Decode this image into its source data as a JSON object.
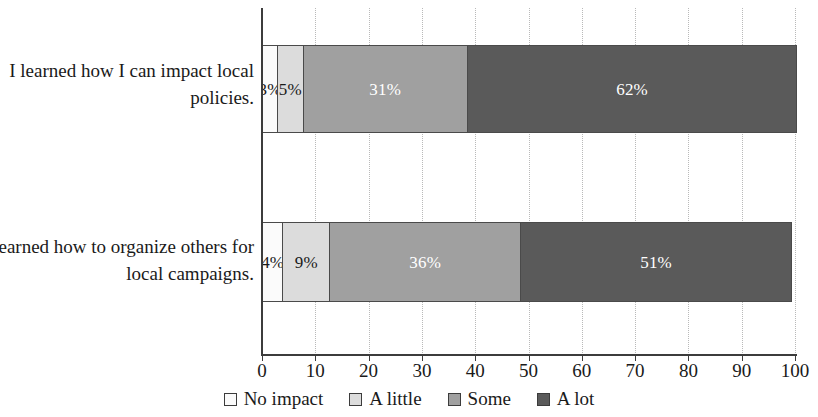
{
  "chart_data": {
    "type": "bar",
    "orientation": "horizontal",
    "stacked": true,
    "stack_mode": "percent",
    "title": "",
    "subtitle": "",
    "xlabel": "",
    "ylabel": "",
    "categories": [
      "I learned how I can impact local policies.",
      "I learned how to organize others for local campaigns."
    ],
    "series": [
      {
        "name": "No impact",
        "values": [
          3,
          4
        ],
        "color": "#fbfbfb"
      },
      {
        "name": "A little",
        "values": [
          5,
          9
        ],
        "color": "#dcdcdc"
      },
      {
        "name": "Some",
        "values": [
          31,
          36
        ],
        "color": "#a0a0a0"
      },
      {
        "name": "A lot",
        "values": [
          62,
          51
        ],
        "color": "#5a5a5a"
      }
    ],
    "data_labels": [
      [
        "3%",
        "5%",
        "31%",
        "62%"
      ],
      [
        "4%",
        "9%",
        "36%",
        "51%"
      ]
    ],
    "label_text_tone": [
      [
        "dark",
        "dark",
        "light",
        "light"
      ],
      [
        "dark",
        "dark",
        "light",
        "light"
      ]
    ],
    "xlim": [
      0,
      100
    ],
    "xticks": [
      0,
      10,
      20,
      30,
      40,
      50,
      60,
      70,
      80,
      90,
      100
    ],
    "xtick_labels": [
      "0",
      "10",
      "20",
      "30",
      "40",
      "50",
      "60",
      "70",
      "80",
      "90",
      "100"
    ],
    "grid": {
      "vertical": true,
      "horizontal": false,
      "style": "dotted",
      "color": "#b9b9b9"
    },
    "legend": {
      "position": "bottom-center",
      "entries": [
        {
          "label": "No impact",
          "color": "#fbfbfb"
        },
        {
          "label": "A little",
          "color": "#dcdcdc"
        },
        {
          "label": "Some",
          "color": "#a0a0a0"
        },
        {
          "label": "A lot",
          "color": "#5a5a5a"
        }
      ]
    },
    "axis_color": "#3c3c3c",
    "background": "#ffffff"
  }
}
